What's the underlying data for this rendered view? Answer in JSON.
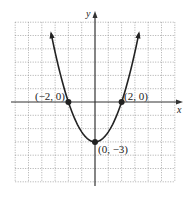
{
  "chart_data": {
    "type": "line",
    "title": "",
    "xlabel": "x",
    "ylabel": "y",
    "xlim": [
      -6,
      6
    ],
    "ylim": [
      -6,
      6
    ],
    "grid": true,
    "equation": "y = (3/4)x^2 - 3",
    "series": [
      {
        "name": "parabola",
        "x": [
          -3.3,
          -3,
          -2,
          -1,
          0,
          1,
          2,
          3,
          3.3
        ],
        "y": [
          5.17,
          3.75,
          0,
          -2.25,
          -3,
          -2.25,
          0,
          3.75,
          5.17
        ]
      }
    ],
    "points": [
      {
        "x": -2,
        "y": 0,
        "label": "(−2, 0)"
      },
      {
        "x": 2,
        "y": 0,
        "label": "(2, 0)"
      },
      {
        "x": 0,
        "y": -3,
        "label": "(0, −3)"
      }
    ]
  }
}
